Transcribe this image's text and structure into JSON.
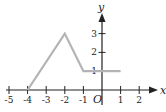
{
  "chart_data": {
    "type": "line",
    "title": "",
    "xlabel": "x",
    "ylabel": "y",
    "origin_label": "O",
    "x_ticks": [
      -5,
      -4,
      -3,
      -2,
      -1,
      1,
      2
    ],
    "x_tick_labels": [
      "-5",
      "-4",
      "-3",
      "-2",
      "-1",
      "1",
      "2"
    ],
    "y_ticks": [
      1,
      2,
      3
    ],
    "y_tick_labels": [
      "1",
      "2",
      "3"
    ],
    "xlim": [
      -5,
      2.5
    ],
    "ylim": [
      0,
      4
    ],
    "grid": false,
    "series": [
      {
        "name": "graph",
        "color": "#b3b3b3",
        "x": [
          -4,
          -2,
          -1,
          1
        ],
        "y": [
          0,
          3,
          1,
          1
        ]
      }
    ],
    "axis_color": "#222222"
  }
}
